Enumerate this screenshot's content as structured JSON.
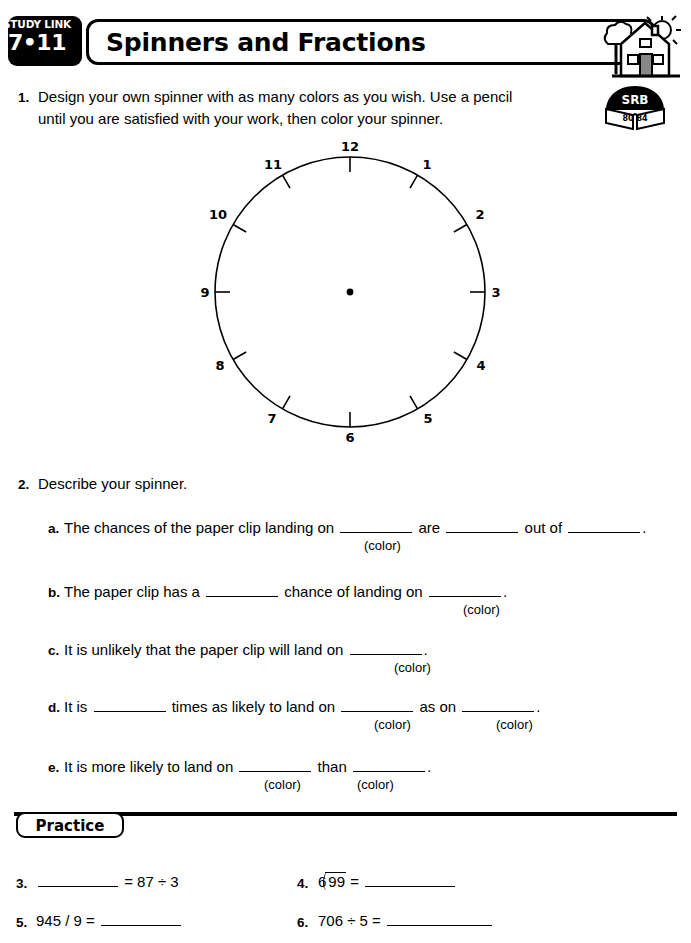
{
  "header": {
    "study_link_label": "STUDY LINK",
    "study_link_number": "7•11",
    "title": "Spinners and Fractions",
    "house_icon": "house-with-sun-icon"
  },
  "srb": {
    "label": "SRB",
    "pages": "80  84"
  },
  "problems": [
    {
      "number": "1.",
      "line1": "Design your own spinner with as many colors as you wish. Use a pencil",
      "line2": "until you are satisfied with your work, then color your spinner."
    },
    {
      "number": "2.",
      "prompt": "Describe your spinner."
    }
  ],
  "spinner": {
    "numbers": [
      "12",
      "1",
      "2",
      "3",
      "4",
      "5",
      "6",
      "7",
      "8",
      "9",
      "10",
      "11"
    ],
    "center_dot": true,
    "tick_count": 12
  },
  "parts": {
    "a": {
      "letter": "a.",
      "text_1": "The chances of the paper clip landing on",
      "text_2": "are",
      "text_3": "out of",
      "text_4": ".",
      "color_label": "(color)"
    },
    "b": {
      "letter": "b.",
      "text_1": "The paper clip has a",
      "text_2": "chance of landing on",
      "text_3": ".",
      "color_label": "(color)"
    },
    "c": {
      "letter": "c.",
      "text_1": "It is unlikely that the paper clip will land on",
      "text_2": ".",
      "color_label": "(color)"
    },
    "d": {
      "letter": "d.",
      "text_1": "It is",
      "text_2": "times as likely to land on",
      "text_3": "as on",
      "text_4": ".",
      "color_label_1": "(color)",
      "color_label_2": "(color)"
    },
    "e": {
      "letter": "e.",
      "text_1": "It is more likely to land on",
      "text_2": "than",
      "text_3": ".",
      "color_label_1": "(color)",
      "color_label_2": "(color)"
    }
  },
  "practice": {
    "heading": "Practice",
    "items": [
      {
        "number": "3.",
        "expression": "= 87 ÷ 3"
      },
      {
        "number": "4.",
        "divisor": "6",
        "dividend": "99",
        "equals": "="
      },
      {
        "number": "5.",
        "expression": "945 / 9 ="
      },
      {
        "number": "6.",
        "expression": "706 ÷ 5 ="
      }
    ]
  }
}
